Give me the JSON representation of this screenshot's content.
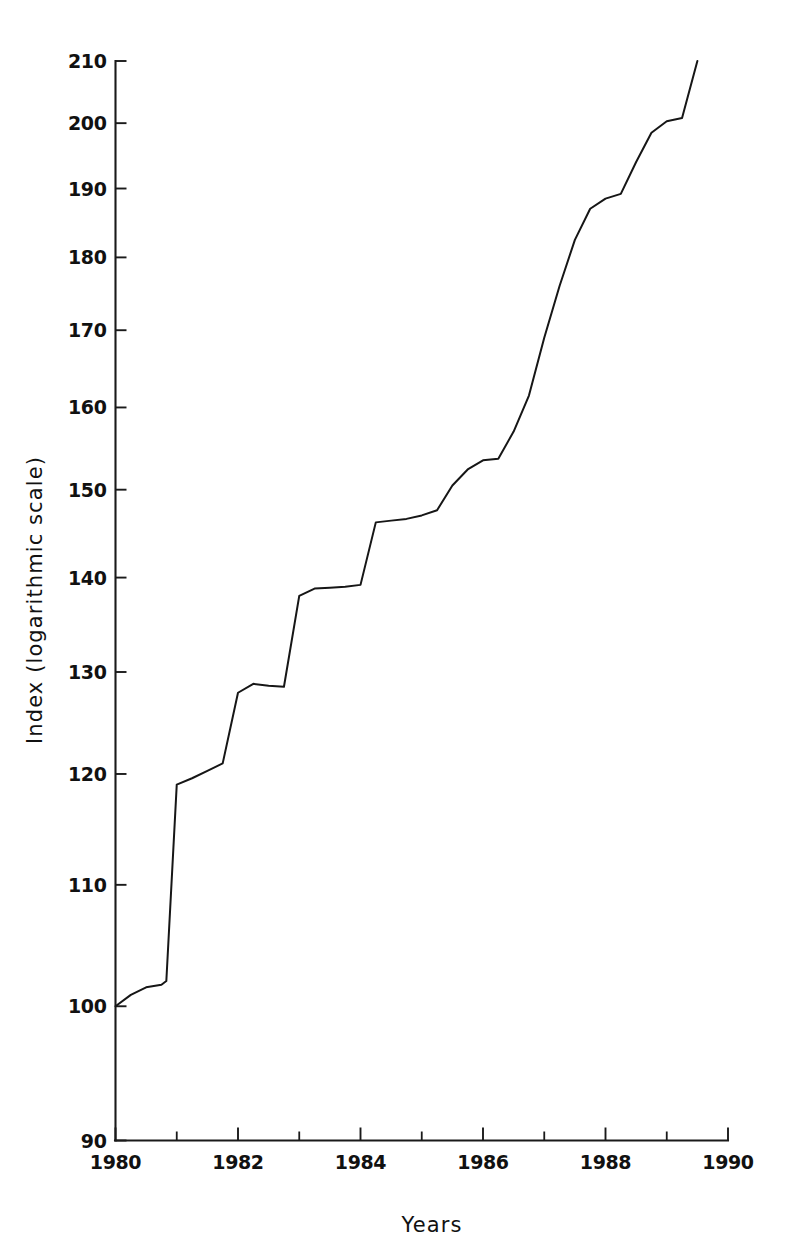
{
  "chart_data": {
    "type": "line",
    "title": "",
    "xlabel": "Years",
    "ylabel": "Index (logarithmic scale)",
    "scale": "logarithmic",
    "xlim": [
      1980,
      1990
    ],
    "ylim": [
      90,
      210
    ],
    "grid": false,
    "legend": null,
    "line_color": "#161616",
    "background_color": "#ffffff",
    "axis_color": "#1a1a1a",
    "x_ticks_major": [
      1980,
      1982,
      1984,
      1986,
      1988,
      1990
    ],
    "x_tick_labels": [
      "1980",
      "1982",
      "1984",
      "1986",
      "1988",
      "1990"
    ],
    "x_ticks_minor": [
      1981,
      1983,
      1985,
      1987,
      1989
    ],
    "y_ticks": [
      90,
      100,
      110,
      120,
      130,
      140,
      150,
      160,
      170,
      180,
      190,
      200,
      210
    ],
    "y_tick_labels": [
      "90",
      "100",
      "110",
      "120",
      "130",
      "140",
      "150",
      "160",
      "170",
      "180",
      "190",
      "200",
      "210"
    ],
    "series": [
      {
        "name": "Index",
        "x": [
          1980.0,
          1980.25,
          1980.5,
          1980.75,
          1980.83,
          1981.0,
          1981.25,
          1981.5,
          1981.75,
          1982.0,
          1982.25,
          1982.5,
          1982.75,
          1983.0,
          1983.25,
          1983.5,
          1983.75,
          1984.0,
          1984.25,
          1984.5,
          1984.75,
          1985.0,
          1985.25,
          1985.5,
          1985.75,
          1986.0,
          1986.25,
          1986.5,
          1986.75,
          1987.0,
          1987.25,
          1987.5,
          1987.75,
          1988.0,
          1988.25,
          1988.5,
          1988.75,
          1989.0,
          1989.25,
          1989.5
        ],
        "y": [
          100.0,
          100.9,
          101.5,
          101.7,
          102.0,
          119.0,
          119.6,
          120.3,
          121.0,
          127.9,
          128.8,
          128.6,
          128.5,
          138.0,
          138.8,
          138.9,
          139.0,
          139.2,
          146.2,
          146.4,
          146.6,
          147.0,
          147.6,
          150.5,
          152.4,
          153.5,
          153.7,
          157.0,
          161.5,
          169.0,
          176.0,
          182.5,
          187.0,
          188.5,
          189.2,
          194.0,
          198.5,
          200.3,
          200.8,
          210.0
        ]
      }
    ],
    "annotations": []
  },
  "axes": {
    "y_title": "Index (logarithmic scale)",
    "x_title": "Years"
  }
}
